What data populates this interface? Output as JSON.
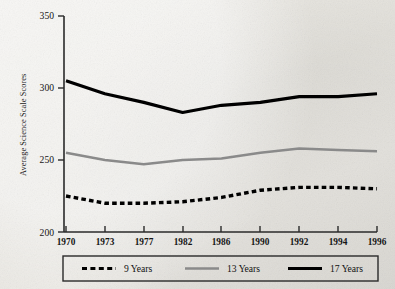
{
  "chart_data": {
    "type": "line",
    "title": "",
    "xlabel": "",
    "ylabel": "Average Science Scale Scores",
    "categories": [
      "1970",
      "1973",
      "1977",
      "1982",
      "1986",
      "1990",
      "1992",
      "1994",
      "1996"
    ],
    "ylim": [
      200,
      350
    ],
    "yticks": [
      200,
      250,
      300,
      350
    ],
    "grid": false,
    "legend_position": "bottom",
    "series": [
      {
        "name": "9 Years",
        "style": "dashed",
        "color": "#000000",
        "values": [
          225,
          220,
          220,
          221,
          224,
          229,
          231,
          231,
          230
        ]
      },
      {
        "name": "13 Years",
        "style": "solid",
        "color": "#8a8a8a",
        "values": [
          255,
          250,
          247,
          250,
          251,
          255,
          258,
          257,
          256
        ]
      },
      {
        "name": "17 Years",
        "style": "solid-bold",
        "color": "#000000",
        "values": [
          305,
          296,
          290,
          283,
          288,
          290,
          294,
          294,
          296
        ]
      }
    ]
  },
  "axis": {
    "ytick_labels": [
      "350",
      "300",
      "250",
      "200"
    ],
    "ylabel_text": "Average Science Scale Scores",
    "xtick_labels": [
      "1970",
      "1973",
      "1977",
      "1982",
      "1986",
      "1990",
      "1992",
      "1994",
      "1996"
    ]
  },
  "legend": {
    "items": [
      {
        "label": "9 Years",
        "swatch": "dashed-black-line"
      },
      {
        "label": "13 Years",
        "swatch": "solid-gray-line"
      },
      {
        "label": "17 Years",
        "swatch": "solid-black-line"
      }
    ]
  }
}
